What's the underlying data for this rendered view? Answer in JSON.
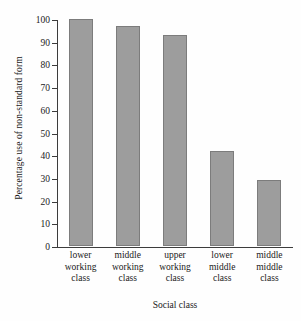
{
  "chart_data": {
    "type": "bar",
    "title": "",
    "xlabel": "Social class",
    "ylabel": "Percentage use of non-standard form",
    "categories": [
      "lower working class",
      "middle working class",
      "upper working class",
      "lower middle class",
      "middle middle class"
    ],
    "category_lines": [
      [
        "lower",
        "working",
        "class"
      ],
      [
        "middle",
        "working",
        "class"
      ],
      [
        "upper",
        "working",
        "class"
      ],
      [
        "lower",
        "middle",
        "class"
      ],
      [
        "middle",
        "middle",
        "class"
      ]
    ],
    "values": [
      100,
      97,
      93,
      42,
      29
    ],
    "ylim": [
      0,
      100
    ],
    "yticks": [
      0,
      10,
      20,
      30,
      40,
      50,
      60,
      70,
      80,
      90,
      100
    ],
    "ytick_labels": [
      "0",
      "10",
      "20",
      "30",
      "40",
      "50",
      "60",
      "70",
      "80",
      "90",
      "100"
    ],
    "grid": false,
    "legend": null,
    "bar_color": "#9d9d9d",
    "bar_border_color": "#7c7c7c",
    "axis_color": "#3c3c3c",
    "background_color": "#ffffff"
  }
}
